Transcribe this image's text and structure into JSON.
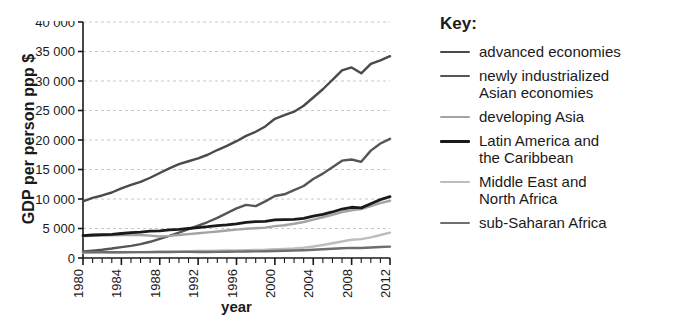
{
  "chart_data": {
    "type": "line",
    "title": "",
    "xlabel": "year",
    "ylabel": "GDP per person ppp $",
    "xlim": [
      1980,
      2012
    ],
    "ylim": [
      0,
      40000
    ],
    "ytick_values": [
      0,
      5000,
      10000,
      15000,
      20000,
      25000,
      30000,
      35000,
      40000
    ],
    "ytick_labels": [
      "0",
      "5 000",
      "10 000",
      "15 000",
      "20 000",
      "25 000",
      "30 000",
      "35 000",
      "40 000"
    ],
    "xtick_values": [
      1980,
      1984,
      1988,
      1992,
      1996,
      2000,
      2004,
      2008,
      2012
    ],
    "xtick_labels": [
      "1980",
      "1984",
      "1988",
      "1992",
      "1996",
      "2000",
      "2004",
      "2008",
      "2012"
    ],
    "xtick_minor_step": 1,
    "grid": "horizontal-dashed",
    "legend_position": "right",
    "legend_title": "Key:",
    "x": [
      1980,
      1981,
      1982,
      1983,
      1984,
      1985,
      1986,
      1987,
      1988,
      1989,
      1990,
      1991,
      1992,
      1993,
      1994,
      1995,
      1996,
      1997,
      1998,
      1999,
      2000,
      2001,
      2002,
      2003,
      2004,
      2005,
      2006,
      2007,
      2008,
      2009,
      2010,
      2011,
      2012
    ],
    "series": [
      {
        "name": "advanced economies",
        "color": "#4a4a4a",
        "width": 2.4,
        "values": [
          9600,
          10200,
          10600,
          11100,
          11800,
          12400,
          12900,
          13600,
          14400,
          15200,
          15900,
          16400,
          16900,
          17500,
          18300,
          19000,
          19800,
          20700,
          21400,
          22300,
          23600,
          24200,
          24800,
          25800,
          27200,
          28600,
          30200,
          31800,
          32300,
          31300,
          32900,
          33500,
          34200
        ]
      },
      {
        "name": "newly industrialized Asian economies",
        "color": "#555555",
        "width": 2.4,
        "values": [
          1100,
          1250,
          1400,
          1600,
          1850,
          2050,
          2350,
          2750,
          3250,
          3750,
          4300,
          4900,
          5500,
          6100,
          6800,
          7600,
          8400,
          9000,
          8800,
          9600,
          10500,
          10800,
          11500,
          12200,
          13400,
          14300,
          15400,
          16500,
          16700,
          16300,
          18200,
          19400,
          20200
        ]
      },
      {
        "name": "developing Asia",
        "color": "#a3a3a3",
        "width": 2.4,
        "values": [
          3700,
          3750,
          3800,
          3850,
          3900,
          3950,
          3900,
          3800,
          3650,
          3750,
          3900,
          4050,
          4200,
          4350,
          4500,
          4650,
          4800,
          4950,
          5050,
          5150,
          5400,
          5550,
          5800,
          6100,
          6500,
          6900,
          7300,
          7800,
          8100,
          8300,
          8800,
          9300,
          9700
        ]
      },
      {
        "name": "Latin America and the Caribbean",
        "color": "#1a1a1a",
        "width": 2.8,
        "values": [
          3800,
          3900,
          3950,
          4000,
          4150,
          4300,
          4400,
          4550,
          4600,
          4750,
          4850,
          5000,
          5150,
          5300,
          5500,
          5600,
          5800,
          6050,
          6150,
          6200,
          6450,
          6500,
          6550,
          6700,
          7100,
          7400,
          7800,
          8300,
          8600,
          8500,
          9200,
          9900,
          10400
        ]
      },
      {
        "name": "Middle East and North Africa",
        "color": "#bdbdbd",
        "width": 2.4,
        "values": [
          900,
          900,
          920,
          940,
          960,
          980,
          1000,
          1020,
          1050,
          1080,
          1120,
          1150,
          1180,
          1200,
          1230,
          1260,
          1300,
          1340,
          1380,
          1420,
          1500,
          1550,
          1620,
          1750,
          1950,
          2200,
          2500,
          2800,
          3100,
          3200,
          3500,
          3900,
          4300
        ]
      },
      {
        "name": "sub-Saharan Africa",
        "color": "#6e6e6e",
        "width": 2.4,
        "values": [
          1000,
          1000,
          990,
          980,
          980,
          990,
          1000,
          1000,
          1010,
          1020,
          1030,
          1030,
          1020,
          1020,
          1030,
          1050,
          1080,
          1100,
          1120,
          1140,
          1180,
          1220,
          1260,
          1320,
          1400,
          1480,
          1560,
          1650,
          1720,
          1700,
          1780,
          1860,
          1920
        ]
      }
    ]
  },
  "legend": {
    "title": "Key:",
    "items": [
      {
        "label": "advanced economies"
      },
      {
        "label": "newly industrialized\nAsian economies"
      },
      {
        "label": "developing Asia"
      },
      {
        "label": "Latin America and\nthe Caribbean"
      },
      {
        "label": "Middle East and\nNorth Africa"
      },
      {
        "label": "sub-Saharan Africa"
      }
    ]
  }
}
